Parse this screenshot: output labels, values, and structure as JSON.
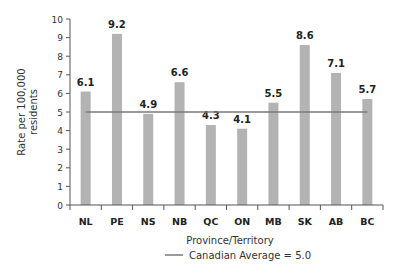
{
  "chart_data": {
    "type": "bar",
    "title": "",
    "xlabel": "Province/Territory",
    "ylabel": "Rate per 100,000 residents",
    "ylabel_lines": [
      "Rate per 100,000",
      "residents"
    ],
    "categories": [
      "NL",
      "PE",
      "NS",
      "NB",
      "QC",
      "ON",
      "MB",
      "SK",
      "AB",
      "BC"
    ],
    "values": [
      6.1,
      9.2,
      4.9,
      6.6,
      4.3,
      4.1,
      5.5,
      8.6,
      7.1,
      5.7
    ],
    "value_labels": [
      "6.1",
      "9.2",
      "4.9",
      "6.6",
      "4.3",
      "4.1",
      "5.5",
      "8.6",
      "7.1",
      "5.7"
    ],
    "ylim": [
      0,
      10
    ],
    "yticks": [
      0,
      1,
      2,
      3,
      4,
      5,
      6,
      7,
      8,
      9,
      10
    ],
    "grid": false,
    "reference_line": {
      "label": "Canadian Average = 5.0",
      "value": 5.0
    },
    "legend": {
      "position": "bottom",
      "entries": [
        "Canadian Average = 5.0"
      ]
    },
    "colors": {
      "bar": "#b3b3b3",
      "reference_line": "#7a7a7a",
      "axis": "#555555"
    }
  }
}
